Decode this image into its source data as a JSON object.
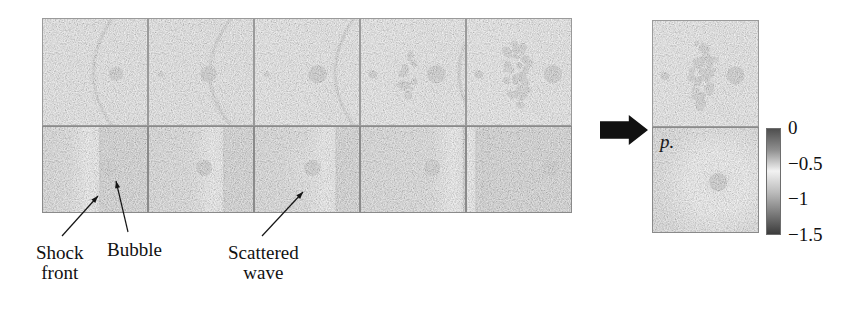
{
  "figure": {
    "kind": "shock-bubble-interaction-sequence",
    "background_color": "#ffffff"
  },
  "sequence": {
    "frame_count": 5,
    "top_row": {
      "name": "experimental-shadowgraph-row",
      "x": 42,
      "y": 18,
      "panel_width": 106,
      "panel_height": 108,
      "frames": [
        {
          "id": "exp-1",
          "shock_x_frac": 0.5,
          "shock_curve": 0.3,
          "bubble_x_frac": 0.7,
          "bubble_r": 7,
          "cloud": 0,
          "halo": 0,
          "small_dot": 0,
          "bg": "#c9c9c9"
        },
        {
          "id": "exp-2",
          "shock_x_frac": 0.6,
          "shock_curve": 0.34,
          "bubble_x_frac": 0.57,
          "bubble_r": 8,
          "cloud": 0,
          "halo": 0,
          "small_dot": 1,
          "bg": "#c6c6c6"
        },
        {
          "id": "exp-3",
          "shock_x_frac": 0.78,
          "shock_curve": 0.3,
          "bubble_x_frac": 0.6,
          "bubble_r": 9,
          "cloud": 0,
          "halo": 1,
          "small_dot": 1,
          "bg": "#cfcfcf"
        },
        {
          "id": "exp-4",
          "shock_x_frac": 0.95,
          "shock_curve": 0.34,
          "bubble_x_frac": 0.72,
          "bubble_r": 9,
          "cloud": 1,
          "halo": 1,
          "small_dot": 1,
          "bg": "#d2d2d2"
        },
        {
          "id": "exp-5",
          "shock_x_frac": 1.05,
          "shock_curve": 0.4,
          "bubble_x_frac": 0.82,
          "bubble_r": 9,
          "cloud": 2,
          "halo": 1,
          "small_dot": 1,
          "bg": "#d4d4d4"
        }
      ]
    },
    "bottom_row": {
      "name": "computed-pressure-row",
      "x": 42,
      "y": 126,
      "panel_width": 106,
      "panel_height": 87,
      "frames": [
        {
          "id": "sim-1",
          "shock_x_frac": 0.55,
          "bubble_x_frac": 0.63,
          "bubble_r": 8,
          "scatter_halo": 0,
          "extra_lines": 0,
          "blob": 0
        },
        {
          "id": "sim-2",
          "shock_x_frac": 0.72,
          "bubble_x_frac": 0.53,
          "bubble_r": 8,
          "scatter_halo": 0,
          "extra_lines": 0,
          "blob": 0
        },
        {
          "id": "sim-3",
          "shock_x_frac": 0.78,
          "bubble_x_frac": 0.55,
          "bubble_r": 8,
          "scatter_halo": 1,
          "extra_lines": 0,
          "blob": 0
        },
        {
          "id": "sim-4",
          "shock_x_frac": 0.98,
          "bubble_x_frac": 0.68,
          "bubble_r": 8,
          "scatter_halo": 0,
          "extra_lines": 0,
          "blob": 1
        },
        {
          "id": "sim-5",
          "shock_x_frac": 0.1,
          "bubble_x_frac": 0.8,
          "bubble_r": 8,
          "scatter_halo": 0,
          "extra_lines": 1,
          "blob": 0
        }
      ]
    }
  },
  "annotations": {
    "shock_front": {
      "label": "Shock\nfront",
      "x": 36,
      "y": 243,
      "target_x": 98,
      "target_y": 196
    },
    "bubble": {
      "label": "Bubble",
      "x": 107,
      "y": 240,
      "target_x": 116,
      "target_y": 181
    },
    "scattered_wave": {
      "label": "Scattered\nwave",
      "x": 228,
      "y": 243,
      "target_x": 303,
      "target_y": 192
    }
  },
  "transition": {
    "icon": "right-arrow-icon",
    "x": 600,
    "y": 112,
    "width": 48,
    "height": 36,
    "color": "#111111"
  },
  "final_panel": {
    "name": "final-state-panel",
    "x": 652,
    "y": 20,
    "width": 107,
    "top": {
      "id": "exp-final",
      "height": 107,
      "label": ""
    },
    "bottom": {
      "id": "sim-final",
      "height": 106,
      "label": "p."
    }
  },
  "colorbar": {
    "name": "pressure-colorbar",
    "x": 766,
    "y": 128,
    "width": 15,
    "height": 107,
    "variable": "p",
    "ticks": [
      "0",
      "−0.5",
      "−1",
      "−1.5"
    ],
    "tick_values": [
      0,
      -0.5,
      -1,
      -1.5
    ],
    "min": -1.5,
    "max": 0,
    "gradient_stops": [
      "#4f4f4f",
      "#8f8f8f",
      "#f2f2f2",
      "#bdbdbd",
      "#7d7d7d",
      "#3c3c3c"
    ]
  },
  "chart_data": {
    "type": "heatmap",
    "title": "",
    "xlabel": "",
    "ylabel": "",
    "colorbar_label": "p.",
    "colorbar_ticks": [
      0,
      -0.5,
      -1,
      -1.5
    ],
    "colorbar_range": [
      -1.5,
      0
    ],
    "series": [
      {
        "name": "experimental-shadowgraph",
        "frames": 5
      },
      {
        "name": "computed-pressure",
        "frames": 5
      }
    ],
    "annotations": [
      "Shock front",
      "Bubble",
      "Scattered wave"
    ]
  }
}
